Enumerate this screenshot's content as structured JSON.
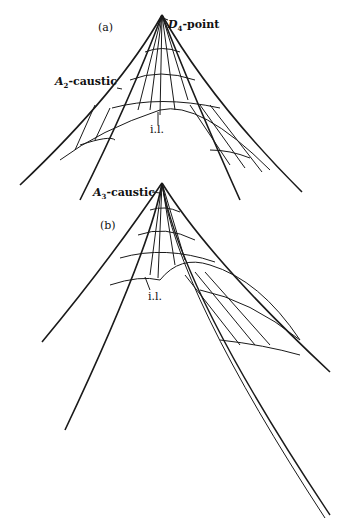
{
  "figure": {
    "panels": [
      {
        "id": "a",
        "label": "(a)",
        "apex_label": "D4-point",
        "caustic_label": "A2-caustic",
        "line_label": "i.l."
      },
      {
        "id": "b",
        "label": "(b)",
        "caustic_label": "A3-caustic",
        "line_label": "i.l."
      }
    ],
    "ink_color": "#1a1a1a",
    "background": "#ffffff"
  }
}
